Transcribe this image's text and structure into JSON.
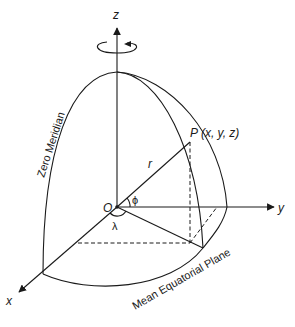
{
  "diagram": {
    "axes": {
      "z_label": "z",
      "y_label": "y",
      "x_label": "x"
    },
    "origin_label": "O",
    "point_label": "P (x, y, z)",
    "radius_label": "r",
    "latitude_label": "ϕ",
    "longitude_label": "λ",
    "zero_meridian_label": "Zero Meridian",
    "equatorial_plane_label": "Mean Equatorial Plane",
    "rotation_indicator": "counter-clockwise rotation about z-axis"
  },
  "colors": {
    "stroke": "#1a1a1a",
    "background": "#ffffff"
  }
}
